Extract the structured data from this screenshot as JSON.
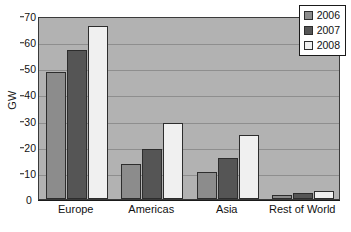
{
  "chart_data": {
    "type": "bar",
    "title": "",
    "subtitle": "",
    "xlabel": "",
    "ylabel": "GW",
    "ylim": [
      0,
      70
    ],
    "yticks": [
      0,
      10,
      20,
      30,
      40,
      50,
      60,
      70
    ],
    "grid": true,
    "legend_position": "top-right",
    "categories": [
      "Europe",
      "Americas",
      "Asia",
      "Rest of World"
    ],
    "series": [
      {
        "name": "2006",
        "color": "#8c8c8c",
        "values": [
          48.7,
          13.5,
          10.3,
          1.5
        ]
      },
      {
        "name": "2007",
        "color": "#555555",
        "values": [
          57.0,
          19.0,
          15.7,
          2.3
        ]
      },
      {
        "name": "2008",
        "color": "#f0f0f0",
        "values": [
          66.0,
          29.0,
          24.3,
          3.0
        ]
      }
    ]
  },
  "axes": {
    "y_title": "GW",
    "y_tick_labels": [
      "0",
      "10",
      "20",
      "30",
      "40",
      "50",
      "60",
      "70"
    ],
    "x_tick_labels": [
      "Europe",
      "Americas",
      "Asia",
      "Rest of World"
    ]
  },
  "legend": {
    "entries": [
      {
        "label": "2006",
        "color": "#8c8c8c"
      },
      {
        "label": "2007",
        "color": "#555555"
      },
      {
        "label": "2008",
        "color": "#f0f0f0"
      }
    ]
  },
  "style": {
    "plot_background": "#b2b2b2",
    "gridline_color": "#8e8e8e",
    "axis_color": "#1a1a1a",
    "bar_border": "#2d2d2d",
    "page_background": "#ffffff",
    "text_color": "#111111"
  }
}
